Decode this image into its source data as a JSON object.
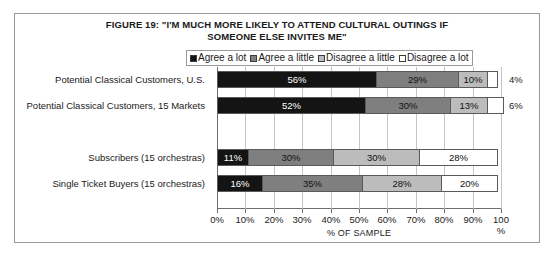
{
  "figure": {
    "title_line1": "FIGURE 19: \"I'M MUCH MORE LIKELY TO ATTEND CULTURAL OUTINGS IF",
    "title_line2": "SOMEONE ELSE INVITES ME\""
  },
  "legend": {
    "items": [
      {
        "label": "Agree a lot",
        "color": "#141414"
      },
      {
        "label": "Agree a little",
        "color": "#7f7f7f"
      },
      {
        "label": "Disagree a little",
        "color": "#bcbcbc"
      },
      {
        "label": "Disagree a lot",
        "color": "#ffffff"
      }
    ]
  },
  "axis": {
    "ticks": [
      "0%",
      "10%",
      "20%",
      "30%",
      "40%",
      "50%",
      "60%",
      "70%",
      "80%",
      "90%",
      "100"
    ],
    "last_tick_second_line": "%",
    "title": "% OF SAMPLE"
  },
  "rows": [
    {
      "label": "Potential Classical Customers, U.S.",
      "segments": [
        {
          "series": "Agree a lot",
          "value": 56,
          "text": "56%"
        },
        {
          "series": "Agree a little",
          "value": 29,
          "text": "29%"
        },
        {
          "series": "Disagree a little",
          "value": 10,
          "text": "10%"
        },
        {
          "series": "Disagree a lot",
          "value": 4,
          "text": ""
        }
      ],
      "outside_label": "4%"
    },
    {
      "label": "Potential Classical Customers, 15 Markets",
      "segments": [
        {
          "series": "Agree a lot",
          "value": 52,
          "text": "52%"
        },
        {
          "series": "Agree a little",
          "value": 30,
          "text": "30%"
        },
        {
          "series": "Disagree a little",
          "value": 13,
          "text": "13%"
        },
        {
          "series": "Disagree a lot",
          "value": 6,
          "text": ""
        }
      ],
      "outside_label": "6%"
    },
    {
      "label": "",
      "segments": [],
      "outside_label": ""
    },
    {
      "label": "Subscribers (15 orchestras)",
      "segments": [
        {
          "series": "Agree a lot",
          "value": 11,
          "text": "11%"
        },
        {
          "series": "Agree a little",
          "value": 30,
          "text": "30%"
        },
        {
          "series": "Disagree a little",
          "value": 30,
          "text": "30%"
        },
        {
          "series": "Disagree a lot",
          "value": 28,
          "text": "28%"
        }
      ],
      "outside_label": ""
    },
    {
      "label": "Single Ticket Buyers (15 orchestras)",
      "segments": [
        {
          "series": "Agree a lot",
          "value": 16,
          "text": "16%"
        },
        {
          "series": "Agree a little",
          "value": 35,
          "text": "35%"
        },
        {
          "series": "Disagree a little",
          "value": 28,
          "text": "28%"
        },
        {
          "series": "Disagree a lot",
          "value": 20,
          "text": "20%"
        }
      ],
      "outside_label": ""
    }
  ],
  "chart_data": {
    "type": "bar",
    "orientation": "horizontal",
    "stacked": true,
    "title": "FIGURE 19: \"I'M MUCH MORE LIKELY TO ATTEND CULTURAL OUTINGS IF SOMEONE ELSE INVITES ME\"",
    "xlabel": "% OF SAMPLE",
    "ylabel": "",
    "xlim": [
      0,
      100
    ],
    "xticks": [
      0,
      10,
      20,
      30,
      40,
      50,
      60,
      70,
      80,
      90,
      100
    ],
    "grid": true,
    "legend_position": "top",
    "categories": [
      "Potential Classical Customers, U.S.",
      "Potential Classical Customers, 15 Markets",
      "Subscribers (15 orchestras)",
      "Single Ticket Buyers (15 orchestras)"
    ],
    "series": [
      {
        "name": "Agree a lot",
        "color": "#141414",
        "values": [
          56,
          52,
          11,
          16
        ]
      },
      {
        "name": "Agree a little",
        "color": "#7f7f7f",
        "values": [
          29,
          30,
          30,
          35
        ]
      },
      {
        "name": "Disagree a little",
        "color": "#bcbcbc",
        "values": [
          10,
          13,
          30,
          28
        ]
      },
      {
        "name": "Disagree a lot",
        "color": "#ffffff",
        "values": [
          4,
          6,
          28,
          20
        ]
      }
    ],
    "annotations": [
      {
        "category": "Potential Classical Customers, U.S.",
        "series": "Disagree a lot",
        "text": "4%",
        "placement": "outside-right"
      },
      {
        "category": "Potential Classical Customers, 15 Markets",
        "series": "Disagree a lot",
        "text": "6%",
        "placement": "outside-right"
      }
    ]
  }
}
